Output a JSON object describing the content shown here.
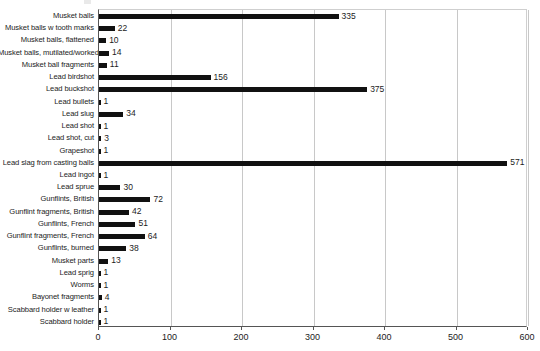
{
  "chart_data": {
    "type": "bar",
    "orientation": "horizontal",
    "title": "",
    "xlabel": "",
    "ylabel": "",
    "xlim": [
      0,
      600
    ],
    "xticks": [
      0,
      100,
      200,
      300,
      400,
      500,
      600
    ],
    "grid": true,
    "legend": false,
    "bar_color": "#111111",
    "categories": [
      "Musket balls",
      "Musket balls w tooth marks",
      "Musket balls, flattened",
      "Musket balls, mutilated/worked",
      "Musket ball fragments",
      "Lead birdshot",
      "Lead buckshot",
      "Lead bullets",
      "Lead slug",
      "Lead shot",
      "Lead shot, cut",
      "Grapeshot",
      "Lead slag from casting balls",
      "Lead ingot",
      "Lead sprue",
      "Gunflints, British",
      "Gunflint fragments, British",
      "Gunflints, French",
      "Gunflint fragments, French",
      "Gunflints, burned",
      "Musket parts",
      "Lead sprig",
      "Worms",
      "Bayonet fragments",
      "Scabbard holder w leather",
      "Scabbard holder"
    ],
    "values": [
      335,
      22,
      10,
      14,
      11,
      156,
      375,
      1,
      34,
      1,
      3,
      1,
      571,
      1,
      30,
      72,
      42,
      51,
      64,
      38,
      13,
      1,
      1,
      4,
      1,
      1
    ],
    "data_labels": [
      "335",
      "22",
      "10",
      "14",
      "11",
      "156",
      "375",
      "1",
      "34",
      "1",
      "3",
      "1",
      "571",
      "1",
      "30",
      "72",
      "42",
      "51",
      "64",
      "38",
      "13",
      "1",
      "1",
      "4",
      "1",
      "1"
    ]
  }
}
